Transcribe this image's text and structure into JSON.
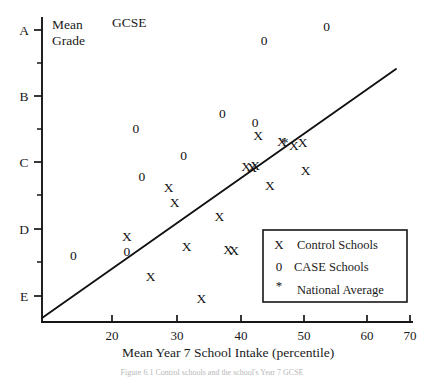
{
  "chart_data": {
    "type": "scatter",
    "title": "",
    "xlabel": "Mean Year 7 School Intake (percentile)",
    "ylabel_line1": "Mean",
    "ylabel_line2": "Grade",
    "plot_annotation": "GCSE",
    "xlim": [
      12,
      73
    ],
    "ylim_grades": [
      "A",
      "B",
      "C",
      "D",
      "E"
    ],
    "grid": false,
    "xticks": [
      20,
      30,
      40,
      50,
      60,
      70
    ],
    "xtick_labels": [
      "20",
      "30",
      "40",
      "50",
      "60",
      "70"
    ],
    "yticks": [
      "A",
      "B",
      "C",
      "D",
      "E"
    ],
    "ytick_labels": [
      "A",
      "B",
      "C",
      "D",
      "E"
    ],
    "y_minor_ticks": 4,
    "legend": {
      "position": "lower-right-inset",
      "entries": [
        {
          "symbol": "X",
          "label": "Control Schools"
        },
        {
          "symbol": "0",
          "label": "CASE Schools"
        },
        {
          "symbol": "*",
          "label": "National Average"
        }
      ]
    },
    "trend_line": {
      "label": "regression line",
      "x_start": 16.5,
      "y_start_grade": "E-",
      "x_end": 70.5,
      "y_end_grade": "B+"
    },
    "series": [
      {
        "name": "Control Schools",
        "symbol": "X",
        "points": [
          {
            "x": 22.5,
            "y_px": 241
          },
          {
            "x": 26.5,
            "y_px": 281
          },
          {
            "x": 29.5,
            "y_px": 192
          },
          {
            "x": 30.5,
            "y_px": 207
          },
          {
            "x": 32.5,
            "y_px": 251
          },
          {
            "x": 35.0,
            "y_px": 303
          },
          {
            "x": 38.0,
            "y_px": 221
          },
          {
            "x": 39.5,
            "y_px": 254
          },
          {
            "x": 40.5,
            "y_px": 255
          },
          {
            "x": 42.5,
            "y_px": 171
          },
          {
            "x": 43.5,
            "y_px": 172
          },
          {
            "x": 44.0,
            "y_px": 170
          },
          {
            "x": 44.5,
            "y_px": 140
          },
          {
            "x": 46.5,
            "y_px": 190
          },
          {
            "x": 48.5,
            "y_px": 146
          },
          {
            "x": 50.5,
            "y_px": 150
          },
          {
            "x": 52.0,
            "y_px": 147
          },
          {
            "x": 52.5,
            "y_px": 175
          }
        ]
      },
      {
        "name": "CASE Schools",
        "symbol": "0",
        "points": [
          {
            "x": 13.5,
            "y_px": 260
          },
          {
            "x": 22.5,
            "y_px": 256
          },
          {
            "x": 24.0,
            "y_px": 133
          },
          {
            "x": 25.0,
            "y_px": 181
          },
          {
            "x": 32.0,
            "y_px": 160
          },
          {
            "x": 38.5,
            "y_px": 118
          },
          {
            "x": 44.0,
            "y_px": 127
          },
          {
            "x": 45.5,
            "y_px": 45
          },
          {
            "x": 56.0,
            "y_px": 31
          }
        ]
      },
      {
        "name": "National Average",
        "symbol": "*",
        "points": [
          {
            "x": 49.0,
            "y_px": 148
          }
        ]
      }
    ]
  },
  "figure_caption": "Figure 6.1 Control schools and the school's Year 7 GCSE"
}
